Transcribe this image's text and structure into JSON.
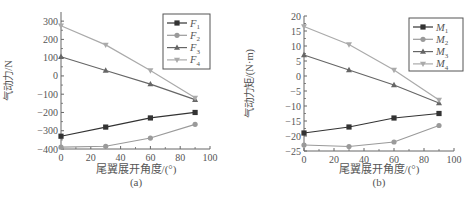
{
  "chart_data": [
    {
      "type": "line",
      "panel_label": "(a)",
      "title": "",
      "xlabel": "尾翼展开角度/(°)",
      "ylabel": "气动力/N",
      "x": [
        0,
        30,
        60,
        90
      ],
      "xlim": [
        0,
        100
      ],
      "ylim": [
        -400,
        350
      ],
      "xticks": [
        0,
        20,
        40,
        60,
        80,
        100
      ],
      "yticks": [
        300,
        200,
        100,
        0,
        -100,
        -200,
        -300,
        -400
      ],
      "grid": false,
      "legend_position": "upper right",
      "series": [
        {
          "name": "F1",
          "label_main": "F",
          "label_sub": "1",
          "marker": "square",
          "color": "#333333",
          "values": [
            -330,
            -280,
            -230,
            -200
          ]
        },
        {
          "name": "F2",
          "label_main": "F",
          "label_sub": "2",
          "marker": "circle",
          "color": "#9a9a9a",
          "values": [
            -390,
            -385,
            -340,
            -265
          ]
        },
        {
          "name": "F3",
          "label_main": "F",
          "label_sub": "3",
          "marker": "triangle-up",
          "color": "#666666",
          "values": [
            105,
            30,
            -45,
            -130
          ]
        },
        {
          "name": "F4",
          "label_main": "F",
          "label_sub": "4",
          "marker": "triangle-down",
          "color": "#aaaaaa",
          "values": [
            275,
            170,
            30,
            -120
          ]
        }
      ]
    },
    {
      "type": "line",
      "panel_label": "(b)",
      "title": "",
      "xlabel": "尾翼展开角度/(°)",
      "ylabel": "气动力矩/(N·m)",
      "x": [
        0,
        30,
        60,
        90
      ],
      "xlim": [
        0,
        100
      ],
      "ylim": [
        -25,
        20
      ],
      "xticks": [
        0,
        20,
        40,
        60,
        80,
        100
      ],
      "yticks": [
        20,
        15,
        10,
        5,
        0,
        -5,
        -10,
        -15,
        -20,
        -25
      ],
      "grid": false,
      "legend_position": "upper right",
      "series": [
        {
          "name": "M1",
          "label_main": "M",
          "label_sub": "1",
          "marker": "square",
          "color": "#333333",
          "values": [
            -19,
            -17,
            -14,
            -12.5
          ]
        },
        {
          "name": "M2",
          "label_main": "M",
          "label_sub": "2",
          "marker": "circle",
          "color": "#9a9a9a",
          "values": [
            -23,
            -23.5,
            -22,
            -16.5
          ]
        },
        {
          "name": "M3",
          "label_main": "M",
          "label_sub": "3",
          "marker": "triangle-up",
          "color": "#666666",
          "values": [
            7,
            2,
            -3,
            -9
          ]
        },
        {
          "name": "M4",
          "label_main": "M",
          "label_sub": "4",
          "marker": "triangle-down",
          "color": "#aaaaaa",
          "values": [
            16.5,
            10.5,
            2,
            -8
          ]
        }
      ]
    }
  ]
}
